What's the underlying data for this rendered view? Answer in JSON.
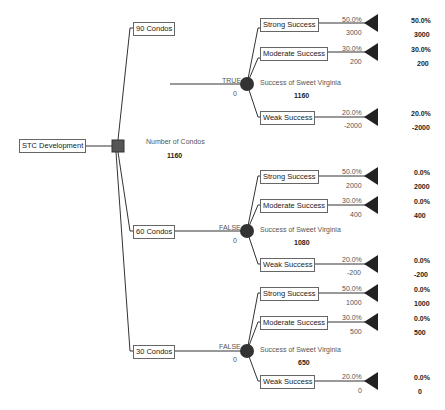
{
  "root": {
    "label": "STC Development",
    "node_label": "Number of Condos",
    "node_value": "1160"
  },
  "branches": [
    {
      "label": "90 Condos",
      "flag": "TRUE",
      "cost": "0",
      "chance_label": "Success of Sweet Virginia",
      "chance_value": "1160",
      "outcomes": [
        {
          "label": "Strong Success",
          "prob": "50.0%",
          "value": "3000",
          "result_prob": "50.0%",
          "result_value": "3000"
        },
        {
          "label": "Moderate Success",
          "prob": "30.0%",
          "value": "200",
          "result_prob": "30.0%",
          "result_value": "200"
        },
        {
          "label": "Weak Success",
          "prob": "20.0%",
          "value": "-2000",
          "result_prob": "20.0%",
          "result_value": "-2000"
        }
      ]
    },
    {
      "label": "60 Condos",
      "flag": "FALSE",
      "cost": "0",
      "chance_label": "Success of Sweet Virginia",
      "chance_value": "1080",
      "outcomes": [
        {
          "label": "Strong Success",
          "prob": "50.0%",
          "value": "2000",
          "result_prob": "0.0%",
          "result_value": "2000"
        },
        {
          "label": "Moderate Success",
          "prob": "30.0%",
          "value": "400",
          "result_prob": "0.0%",
          "result_value": "400"
        },
        {
          "label": "Weak Success",
          "prob": "20.0%",
          "value": "-200",
          "result_prob": "0.0%",
          "result_value": "-200"
        }
      ]
    },
    {
      "label": "30 Condos",
      "flag": "FALSE",
      "cost": "0",
      "chance_label": "Success of Sweet Virginia",
      "chance_value": "650",
      "outcomes": [
        {
          "label": "Strong Success",
          "prob": "50.0%",
          "value": "1000",
          "result_prob": "0.0%",
          "result_value": "1000"
        },
        {
          "label": "Moderate Success",
          "prob": "30.0%",
          "value": "500",
          "result_prob": "0.0%",
          "result_value": "500"
        },
        {
          "label": "Weak Success",
          "prob": "20.0%",
          "value": "0",
          "result_prob": "0.0%",
          "result_value": "0"
        }
      ]
    }
  ],
  "colors": {
    "line": "#333333",
    "node": "#333333",
    "decision_node": "#555555"
  }
}
